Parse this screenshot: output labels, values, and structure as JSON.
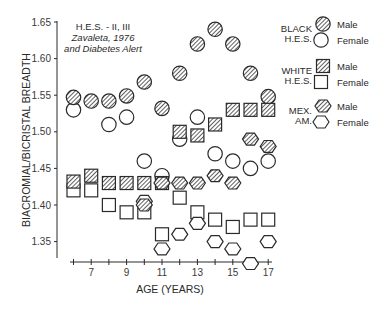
{
  "chart_data": {
    "type": "scatter",
    "title": "",
    "annotation": [
      "H.E.S. - II, III",
      "Zavaleta, 1976",
      "and Diabetes Alert"
    ],
    "xlabel": "AGE (YEARS)",
    "ylabel": "BIACROMIAL/BICRISTAL BREADTH",
    "xlim": [
      6,
      17
    ],
    "ylim": [
      1.32,
      1.65
    ],
    "x_ticks": [
      7,
      9,
      11,
      13,
      15,
      17
    ],
    "y_ticks": [
      1.35,
      1.4,
      1.45,
      1.5,
      1.55,
      1.6,
      1.65
    ],
    "y_tick_labels": [
      "1.35",
      "1.40",
      "1.45",
      "1.50",
      "1.55",
      "1.60",
      "1.65"
    ],
    "grid": false,
    "legend_position": "right",
    "legend": [
      {
        "group": "BLACK H.E.S.",
        "group_lines": [
          "BLACK",
          "H.E.S."
        ],
        "entries": [
          {
            "label": "Male",
            "marker": "circle-hatched"
          },
          {
            "label": "Female",
            "marker": "circle-open"
          }
        ]
      },
      {
        "group": "WHITE H.E.S.",
        "group_lines": [
          "WHITE",
          "H.E.S."
        ],
        "entries": [
          {
            "label": "Male",
            "marker": "square-hatched"
          },
          {
            "label": "Female",
            "marker": "square-open"
          }
        ]
      },
      {
        "group": "MEX. AM.",
        "group_lines": [
          "MEX.",
          "AM."
        ],
        "entries": [
          {
            "label": "Male",
            "marker": "hexagon-hatched"
          },
          {
            "label": "Female",
            "marker": "hexagon-open"
          }
        ]
      }
    ],
    "series": [
      {
        "name": "Black H.E.S. Male",
        "marker": "circle-hatched",
        "x": [
          6,
          7,
          8,
          9,
          10,
          11,
          12,
          13,
          14,
          15,
          16,
          17
        ],
        "y": [
          1.547,
          1.542,
          1.542,
          1.549,
          1.568,
          1.532,
          1.58,
          1.62,
          1.64,
          1.62,
          1.58,
          1.548
        ]
      },
      {
        "name": "Black H.E.S. Female",
        "marker": "circle-open",
        "x": [
          6,
          8,
          9,
          10,
          11,
          12,
          13,
          14,
          15,
          16,
          17
        ],
        "y": [
          1.53,
          1.51,
          1.52,
          1.46,
          1.44,
          1.49,
          1.52,
          1.47,
          1.46,
          1.45,
          1.46
        ]
      },
      {
        "name": "White H.E.S. Male",
        "marker": "square-hatched",
        "x": [
          6,
          7,
          8,
          9,
          10,
          11,
          12,
          13,
          14,
          15,
          16,
          17
        ],
        "y": [
          1.432,
          1.44,
          1.43,
          1.43,
          1.43,
          1.43,
          1.5,
          1.495,
          1.51,
          1.53,
          1.53,
          1.53
        ]
      },
      {
        "name": "White H.E.S. Female",
        "marker": "square-open",
        "x": [
          6,
          7,
          8,
          9,
          10,
          11,
          12,
          13,
          14,
          15,
          16,
          17
        ],
        "y": [
          1.42,
          1.42,
          1.4,
          1.39,
          1.39,
          1.36,
          1.41,
          1.39,
          1.38,
          1.37,
          1.38,
          1.38
        ]
      },
      {
        "name": "Mex. Am. Male",
        "marker": "hexagon-hatched",
        "x": [
          10,
          11,
          12,
          13,
          14,
          15,
          16,
          17
        ],
        "y": [
          1.4,
          1.43,
          1.43,
          1.43,
          1.44,
          1.43,
          1.49,
          1.48
        ]
      },
      {
        "name": "Mex. Am. Female",
        "marker": "hexagon-open",
        "x": [
          10,
          11,
          12,
          13,
          14,
          15,
          16,
          17
        ],
        "y": [
          1.405,
          1.34,
          1.36,
          1.375,
          1.35,
          1.34,
          1.32,
          1.35
        ]
      }
    ]
  },
  "colors": {
    "ink": "#2a2a2a",
    "background": "#ffffff"
  }
}
